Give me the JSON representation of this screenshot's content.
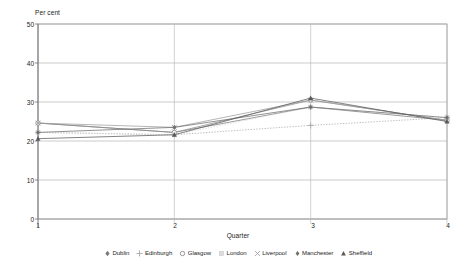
{
  "chart_data": {
    "type": "line",
    "title": "",
    "ylabel": "Per cent",
    "xlabel": "Quarter",
    "categories": [
      "1",
      "2",
      "3",
      "4"
    ],
    "x": [
      1,
      2,
      3,
      4
    ],
    "ylim": [
      0,
      50
    ],
    "yticks": [
      "0",
      "10",
      "20",
      "30",
      "40",
      "50"
    ],
    "ytick_values": [
      0,
      10,
      20,
      30,
      40,
      50
    ],
    "grid": "horizontal",
    "legend_position": "bottom",
    "series": [
      {
        "name": "Dublin",
        "marker": "diamond-filled",
        "color": "#7a7a7a",
        "values": [
          24.6,
          22.2,
          28.7,
          25.3
        ]
      },
      {
        "name": "Edinburgh",
        "marker": "plus",
        "color": "#a8a8a8",
        "values": [
          22.2,
          21.6,
          24.0,
          26.0
        ]
      },
      {
        "name": "Glasgow",
        "marker": "circle-open",
        "color": "#8c8c8c",
        "values": [
          24.6,
          22.2,
          30.5,
          25.3
        ]
      },
      {
        "name": "London",
        "marker": "square-light",
        "color": "#d0d0d0",
        "values": [
          22.2,
          21.6,
          28.7,
          26.0
        ]
      },
      {
        "name": "Liverpool",
        "marker": "cross",
        "color": "#9e9e9e",
        "values": [
          24.6,
          23.5,
          30.5,
          25.3
        ]
      },
      {
        "name": "Manchester",
        "marker": "diamond-small",
        "color": "#6e6e6e",
        "values": [
          22.2,
          23.5,
          28.7,
          26.0
        ]
      },
      {
        "name": "Sheffield",
        "marker": "triangle",
        "color": "#5a5a5a",
        "values": [
          20.6,
          21.6,
          31.0,
          25.0
        ]
      }
    ]
  },
  "legend": {
    "items": [
      {
        "label": "Dublin"
      },
      {
        "label": "Edinburgh"
      },
      {
        "label": "Glasgow"
      },
      {
        "label": "London"
      },
      {
        "label": "Liverpool"
      },
      {
        "label": "Manchester"
      },
      {
        "label": "Sheffield"
      }
    ]
  },
  "axes": {
    "y_title": "Per cent",
    "x_title": "Quarter",
    "y_ticks": [
      "50",
      "40",
      "30",
      "20",
      "10",
      "0"
    ],
    "x_ticks": [
      "1",
      "2",
      "3",
      "4"
    ]
  }
}
